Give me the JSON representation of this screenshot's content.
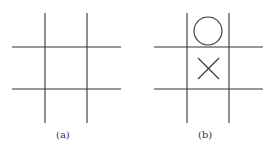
{
  "panels": [
    {
      "label": "(a)",
      "description": "empty tic-tac-toe grid"
    },
    {
      "label": "(b)",
      "description": "tic-tac-toe grid with O in top-center and X in center",
      "marks": [
        {
          "cell": "top-center",
          "symbol": "O"
        },
        {
          "cell": "center",
          "symbol": "X"
        }
      ]
    }
  ],
  "colors": {
    "line": "#333333",
    "background": "#ffffff"
  }
}
